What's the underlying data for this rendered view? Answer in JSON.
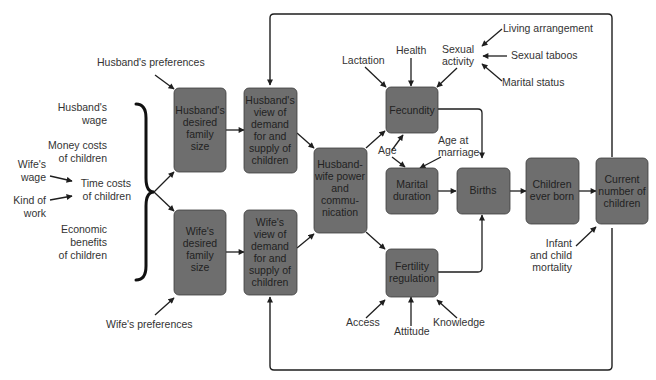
{
  "diagram": {
    "nodes": {
      "husband_desired": {
        "lines": [
          "Husband's",
          "desired",
          "family",
          "size"
        ]
      },
      "husband_view": {
        "lines": [
          "Husband's",
          "view of",
          "demand",
          "for and",
          "supply of",
          "children"
        ]
      },
      "wife_desired": {
        "lines": [
          "Wife's",
          "desired",
          "family",
          "size"
        ]
      },
      "wife_view": {
        "lines": [
          "Wife's",
          "view of",
          "demand",
          "for and",
          "supply of",
          "children"
        ]
      },
      "power": {
        "lines": [
          "Husband-",
          "wife power",
          "and",
          "commu-",
          "nication"
        ]
      },
      "fecundity": {
        "lines": [
          "Fecundity"
        ]
      },
      "marital_duration": {
        "lines": [
          "Marital",
          "duration"
        ]
      },
      "fertility_regulation": {
        "lines": [
          "Fertility",
          "regulation"
        ]
      },
      "births": {
        "lines": [
          "Births"
        ]
      },
      "children_ever_born": {
        "lines": [
          "Children",
          "ever born"
        ]
      },
      "current_number": {
        "lines": [
          "Current",
          "number of",
          "children"
        ]
      }
    },
    "labels": {
      "husbands_preferences": "Husband's preferences",
      "wifes_preferences": "Wife's preferences",
      "husbands_wage": [
        "Husband's",
        "wage"
      ],
      "money_costs": [
        "Money costs",
        "of children"
      ],
      "wifes_wage": [
        "Wife's",
        "wage"
      ],
      "time_costs": [
        "Time costs",
        "of children"
      ],
      "kind_of_work": [
        "Kind of",
        "work"
      ],
      "economic_benefits": [
        "Economic",
        "benefits",
        "of children"
      ],
      "lactation": "Lactation",
      "health": "Health",
      "sexual_activity": [
        "Sexual",
        "activity"
      ],
      "living_arrangement": "Living arrangement",
      "sexual_taboos": "Sexual taboos",
      "marital_status": "Marital status",
      "age": "Age",
      "age_at_marriage": [
        "Age at",
        "marriage"
      ],
      "access": "Access",
      "attitude": "Attitude",
      "knowledge": "Knowledge",
      "infant_mortality": [
        "Infant",
        "and child",
        "mortality"
      ]
    },
    "colors": {
      "node_fill": "#6e6e6e",
      "node_stroke": "#3c3c3c",
      "node_text": "#222222",
      "label_text": "#333333",
      "edge": "#1e1e1e",
      "background": "#ffffff"
    }
  }
}
